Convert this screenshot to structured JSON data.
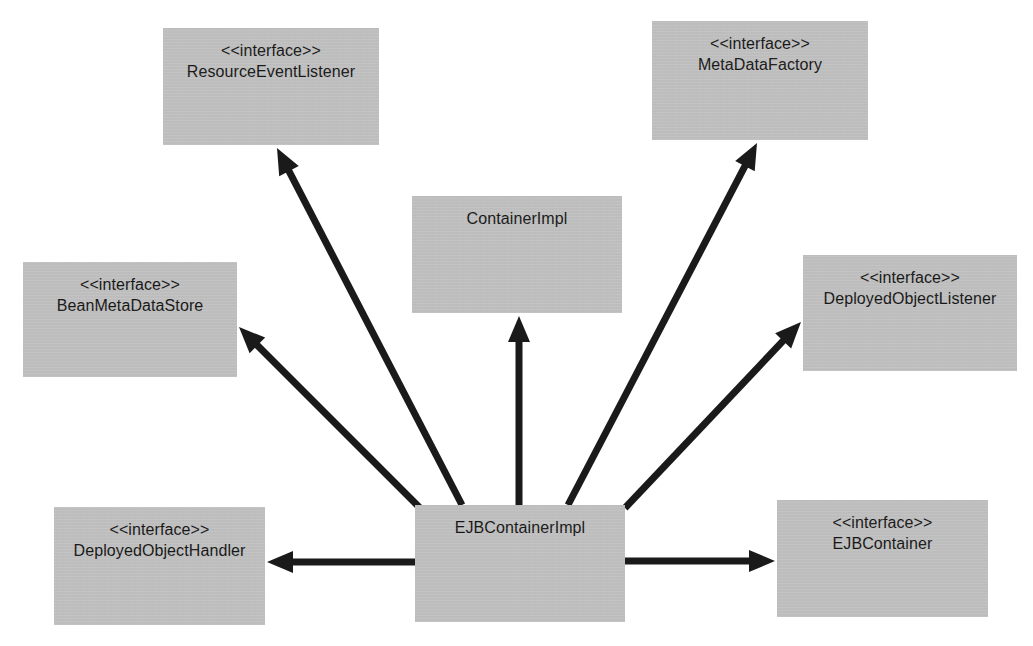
{
  "diagram": {
    "kind": "uml-class-diagram",
    "colors": {
      "node_fill": "#bfbfbf",
      "edge_stroke": "#1a1a1a",
      "text": "#111111",
      "background": "#ffffff"
    },
    "stereotype_label": "<<interface>>",
    "nodes": [
      {
        "id": "resource-event-listener",
        "stereotype": "<<interface>>",
        "name": "ResourceEventListener",
        "x": 163,
        "y": 28,
        "w": 216,
        "h": 117
      },
      {
        "id": "meta-data-factory",
        "stereotype": "<<interface>>",
        "name": "MetaDataFactory",
        "x": 652,
        "y": 21,
        "w": 216,
        "h": 119
      },
      {
        "id": "container-impl",
        "stereotype": "",
        "name": "ContainerImpl",
        "x": 412,
        "y": 196,
        "w": 210,
        "h": 117
      },
      {
        "id": "bean-meta-data-store",
        "stereotype": "<<interface>>",
        "name": "BeanMetaDataStore",
        "x": 23,
        "y": 262,
        "w": 214,
        "h": 115
      },
      {
        "id": "deployed-object-listener",
        "stereotype": "<<interface>>",
        "name": "DeployedObjectListener",
        "x": 803,
        "y": 255,
        "w": 214,
        "h": 116
      },
      {
        "id": "deployed-object-handler",
        "stereotype": "<<interface>>",
        "name": "DeployedObjectHandler",
        "x": 54,
        "y": 507,
        "w": 211,
        "h": 118
      },
      {
        "id": "ejb-container-impl",
        "stereotype": "",
        "name": "EJBContainerImpl",
        "x": 415,
        "y": 505,
        "w": 210,
        "h": 117
      },
      {
        "id": "ejb-container",
        "stereotype": "<<interface>>",
        "name": "EJBContainer",
        "x": 777,
        "y": 500,
        "w": 211,
        "h": 117
      }
    ],
    "edges": [
      {
        "id": "edge-to-resource-event-listener",
        "from": "ejb-container-impl",
        "to": "resource-event-listener",
        "x1": 462,
        "y1": 505,
        "x2": 277,
        "y2": 148,
        "arrow": "filled-triangle"
      },
      {
        "id": "edge-to-bean-meta-data-store",
        "from": "ejb-container-impl",
        "to": "bean-meta-data-store",
        "x1": 420,
        "y1": 508,
        "x2": 239,
        "y2": 327,
        "arrow": "filled-triangle"
      },
      {
        "id": "edge-to-container-impl",
        "from": "ejb-container-impl",
        "to": "container-impl",
        "x1": 519,
        "y1": 505,
        "x2": 519,
        "y2": 316,
        "arrow": "filled-triangle"
      },
      {
        "id": "edge-to-meta-data-factory",
        "from": "ejb-container-impl",
        "to": "meta-data-factory",
        "x1": 568,
        "y1": 505,
        "x2": 757,
        "y2": 143,
        "arrow": "filled-triangle"
      },
      {
        "id": "edge-to-deployed-object-listener",
        "from": "ejb-container-impl",
        "to": "deployed-object-listener",
        "x1": 625,
        "y1": 508,
        "x2": 801,
        "y2": 322,
        "arrow": "filled-triangle"
      },
      {
        "id": "edge-to-deployed-object-handler",
        "from": "ejb-container-impl",
        "to": "deployed-object-handler",
        "x1": 415,
        "y1": 562,
        "x2": 267,
        "y2": 562,
        "arrow": "filled-triangle"
      },
      {
        "id": "edge-to-ejb-container",
        "from": "ejb-container-impl",
        "to": "ejb-container",
        "x1": 625,
        "y1": 561,
        "x2": 775,
        "y2": 561,
        "arrow": "filled-triangle"
      }
    ]
  }
}
